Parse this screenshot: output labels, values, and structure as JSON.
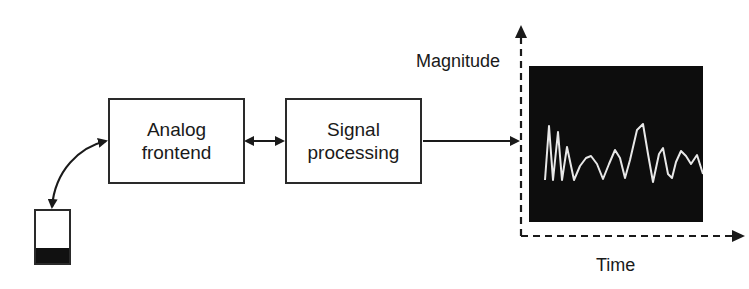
{
  "diagram": {
    "blocks": [
      {
        "id": "analog-frontend",
        "line1": "Analog",
        "line2": "frontend"
      },
      {
        "id": "signal-processing",
        "line1": "Signal",
        "line2": "processing"
      }
    ],
    "axes": {
      "y_label": "Magnitude",
      "x_label": "Time"
    },
    "colors": {
      "stroke": "#2a2a2a",
      "display_bg": "#0d0d0d",
      "waveform": "#e8e8e8"
    },
    "connections": [
      {
        "from": "sensor-device",
        "to": "analog-frontend",
        "type": "bidirectional-curved"
      },
      {
        "from": "analog-frontend",
        "to": "signal-processing",
        "type": "bidirectional"
      },
      {
        "from": "signal-processing",
        "to": "display",
        "type": "unidirectional"
      }
    ]
  }
}
